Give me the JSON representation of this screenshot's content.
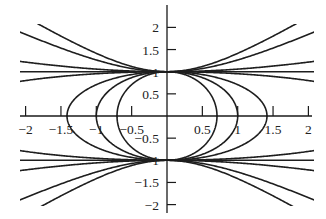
{
  "chart_data": {
    "type": "line",
    "title": "",
    "xlabel": "",
    "ylabel": "",
    "xlim": [
      -2,
      2
    ],
    "ylim": [
      -2,
      2
    ],
    "grid": false,
    "legend": null,
    "x_ticks": [
      -2,
      -1.5,
      -1,
      -0.5,
      0.5,
      1,
      1.5,
      2
    ],
    "x_tick_labels": [
      "−2",
      "−1.5",
      "−1",
      "−0.5",
      "0.5",
      "1",
      "1.5",
      "2"
    ],
    "y_ticks": [
      2,
      1.5,
      1,
      0.5,
      -0.5,
      -1,
      -1.5,
      -2
    ],
    "y_tick_labels": [
      "2",
      "1.5",
      "1",
      "0.5",
      "−0.5",
      "−1",
      "−1.5",
      "−2"
    ],
    "series": [
      {
        "name": "C=1 (hyperbola)",
        "C": 1.0,
        "kind": "hyperbola",
        "samples": [
          {
            "x": 1.0,
            "y": 1.41
          },
          {
            "x": 1.5,
            "y": 1.75
          },
          {
            "x": 1.77,
            "y": 2.05
          }
        ]
      },
      {
        "name": "C=0.6 (hyperbola)",
        "C": 0.6,
        "kind": "hyperbola",
        "samples": [
          {
            "x": 1.0,
            "y": 1.26
          },
          {
            "x": 1.5,
            "y": 1.52
          },
          {
            "x": 2.0,
            "y": 1.87
          }
        ]
      },
      {
        "name": "C=0.12 (hyperbola)",
        "C": 0.12,
        "kind": "hyperbola",
        "samples": [
          {
            "x": 2.0,
            "y": 1.22
          }
        ]
      },
      {
        "name": "C=0 (lines y=±1)",
        "C": 0.0,
        "kind": "line",
        "samples": [
          {
            "x": 2.0,
            "y": 1.0
          }
        ]
      },
      {
        "name": "C=-0.09 (flat ellipse)",
        "C": -0.09,
        "kind": "ellipse",
        "samples": [
          {
            "x": 2.0,
            "y": 0.79
          }
        ]
      },
      {
        "name": "C=-0.5 (ellipse)",
        "C": -0.5,
        "kind": "ellipse",
        "samples": [
          {
            "x": 1.43,
            "y": 0
          }
        ]
      },
      {
        "name": "C=-1 (circle)",
        "C": -1.0,
        "kind": "ellipse",
        "samples": [
          {
            "x": 1.0,
            "y": 0
          }
        ]
      },
      {
        "name": "C=-2 (ellipse)",
        "C": -2.0,
        "kind": "ellipse",
        "samples": [
          {
            "x": 0.72,
            "y": 0
          }
        ]
      }
    ]
  },
  "layout": {
    "origin_px": [
      167,
      116
    ],
    "x_scale_px": 70.7,
    "y_scale_px": 44.3,
    "x_axis_px": [
      20,
      312
    ],
    "y_axis_px": [
      5,
      213
    ],
    "curve_clip_px": {
      "x_min": 20,
      "x_max": 314,
      "y_min": 24,
      "y_max": 206
    },
    "colors": {
      "line": "#1e1e1e",
      "axis": "#1a1a1a",
      "background": "#ffffff"
    }
  }
}
